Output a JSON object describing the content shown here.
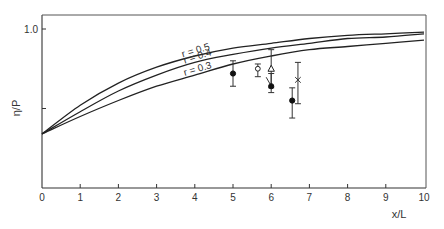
{
  "chart_data": {
    "type": "line",
    "title": "",
    "xlabel": "x/L",
    "ylabel": "η/P",
    "xlim": [
      0,
      10
    ],
    "ylim": [
      0,
      1.09
    ],
    "grid": false,
    "x_ticks": [
      0,
      1,
      2,
      3,
      4,
      5,
      6,
      7,
      8,
      9,
      10
    ],
    "x_tick_labels": [
      "0",
      "1",
      "2",
      "3",
      "4",
      "5",
      "6",
      "7",
      "8",
      "9",
      "10"
    ],
    "y_ticks": [
      0.5,
      1.0
    ],
    "y_tick_labels": [
      "",
      "1.0"
    ],
    "x": [
      0,
      1,
      2,
      3,
      4,
      5,
      6,
      7,
      8,
      9,
      10
    ],
    "series": [
      {
        "name": "r = 0.5",
        "values": [
          0.34,
          0.52,
          0.66,
          0.76,
          0.83,
          0.88,
          0.91,
          0.94,
          0.96,
          0.97,
          0.98
        ],
        "label_at": 3.7
      },
      {
        "name": "r = 0.4",
        "values": [
          0.34,
          0.48,
          0.61,
          0.71,
          0.79,
          0.84,
          0.88,
          0.91,
          0.94,
          0.95,
          0.97
        ],
        "label_at": 3.75
      },
      {
        "name": "r = 0.3",
        "values": [
          0.34,
          0.45,
          0.55,
          0.64,
          0.71,
          0.78,
          0.83,
          0.87,
          0.89,
          0.91,
          0.93
        ],
        "label_at": 3.75
      }
    ],
    "points": [
      {
        "marker": "filled-circle",
        "x": 5.0,
        "y": 0.72,
        "err_low": 0.64,
        "err_high": 0.8
      },
      {
        "marker": "open-circle",
        "x": 5.65,
        "y": 0.75,
        "err_low": 0.7,
        "err_high": 0.78
      },
      {
        "marker": "open-triangle",
        "x": 6.0,
        "y": 0.75,
        "err_low": 0.63,
        "err_high": 0.87
      },
      {
        "marker": "filled-circle",
        "x": 6.0,
        "y": 0.64,
        "err_low": 0.6,
        "err_high": 0.72,
        "leader": true
      },
      {
        "marker": "filled-circle",
        "x": 6.55,
        "y": 0.55,
        "err_low": 0.44,
        "err_high": 0.63
      },
      {
        "marker": "cross",
        "x": 6.7,
        "y": 0.68,
        "err_low": 0.53,
        "err_high": 0.79
      }
    ]
  }
}
